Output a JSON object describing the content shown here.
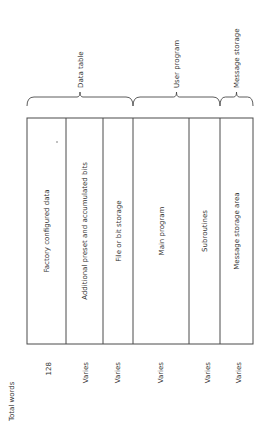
{
  "diagram": {
    "column_header": "Total words",
    "segments": [
      {
        "label": "Factory configured data",
        "words": "128"
      },
      {
        "label": "Additional preset and accumulated bits",
        "words": "Varies"
      },
      {
        "label": "File or bit storage",
        "words": "Varies"
      },
      {
        "label": "Main program",
        "words": "Varies"
      },
      {
        "label": "Subroutines",
        "words": "Varies"
      },
      {
        "label": "Message storage area",
        "words": "Varies"
      }
    ],
    "groups": [
      {
        "label": "Data table",
        "segments": [
          0,
          1,
          2
        ]
      },
      {
        "label": "User program",
        "segments": [
          3,
          4
        ]
      },
      {
        "label": "Message storage",
        "segments": [
          5
        ]
      }
    ],
    "colors": {
      "line": "#4a4a4a",
      "text": "#333333",
      "background": "#ffffff"
    }
  }
}
